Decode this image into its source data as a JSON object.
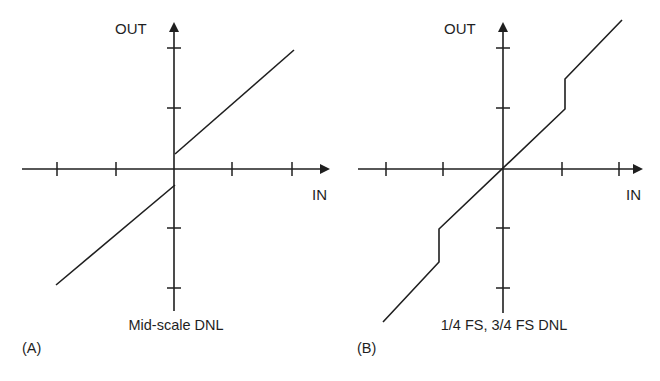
{
  "figure": {
    "colors": {
      "ink": "#1f1f1f",
      "background": "#ffffff"
    },
    "panels": [
      {
        "id": "A",
        "tag": "(A)",
        "caption": "Mid-scale DNL",
        "x_axis_label": "IN",
        "y_axis_label": "OUT",
        "origin": [
          174,
          169
        ],
        "x_axis": {
          "from": 22,
          "to": 330,
          "ticks": [
            57,
            116,
            232,
            292
          ]
        },
        "y_axis": {
          "from": 311,
          "to": 22,
          "ticks": [
            48,
            108,
            228,
            288
          ]
        },
        "segments": [
          {
            "name": "upper-transfer-line",
            "points": [
              [
                175,
                154
              ],
              [
                294,
                50
              ]
            ]
          },
          {
            "name": "lower-transfer-line",
            "points": [
              [
                175,
                185
              ],
              [
                56,
                285
              ]
            ]
          }
        ]
      },
      {
        "id": "B",
        "tag": "(B)",
        "caption": "1/4 FS, 3/4 FS DNL",
        "x_axis_label": "IN",
        "y_axis_label": "OUT",
        "origin": [
          503,
          169
        ],
        "x_axis": {
          "from": 358,
          "to": 643,
          "ticks": [
            386,
            443,
            562,
            619
          ]
        },
        "y_axis": {
          "from": 313,
          "to": 22,
          "ticks": [
            48,
            108,
            228,
            288
          ]
        },
        "segments": [
          {
            "name": "transfer-curve",
            "points": [
              [
                383,
                322
              ],
              [
                439,
                262
              ],
              [
                439,
                229
              ],
              [
                565,
                109
              ],
              [
                565,
                79
              ],
              [
                622,
                20
              ]
            ]
          }
        ]
      }
    ]
  }
}
